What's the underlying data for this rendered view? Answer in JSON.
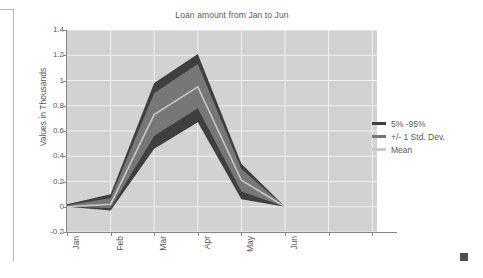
{
  "chart_data": {
    "type": "area",
    "title": "Loan amount from Jan to Jun",
    "xlabel": "",
    "ylabel": "Values in Thousands",
    "categories": [
      "Jan",
      "Feb",
      "Mar",
      "Apr",
      "May",
      "Jun"
    ],
    "ylim": [
      -0.2,
      1.4
    ],
    "yticks": [
      "1.4",
      "1.2",
      "1",
      "0.8",
      "0.6",
      "0.4",
      "0.2",
      "0",
      "-0.2"
    ],
    "ytick_values": [
      1.4,
      1.2,
      1.0,
      0.8,
      0.6,
      0.4,
      0.2,
      0.0,
      -0.2
    ],
    "grid": true,
    "legend_position": "right",
    "series": [
      {
        "name": "5% -95%",
        "band": true,
        "lower": [
          0.0,
          -0.03,
          0.46,
          0.67,
          0.06,
          0.0
        ],
        "upper": [
          0.02,
          0.1,
          0.98,
          1.21,
          0.34,
          0.0
        ],
        "color": "#3f3f3f"
      },
      {
        "name": "+/- 1 Std. Dev.",
        "band": true,
        "lower": [
          0.0,
          -0.01,
          0.56,
          0.78,
          0.12,
          0.0
        ],
        "upper": [
          0.01,
          0.07,
          0.9,
          1.13,
          0.3,
          0.0
        ],
        "color": "#777777"
      },
      {
        "name": "Mean",
        "band": false,
        "values": [
          0.0,
          0.02,
          0.73,
          0.95,
          0.21,
          0.0
        ],
        "color": "#c8c8c8"
      }
    ],
    "legend": [
      {
        "label": "5% -95%",
        "color": "#3f3f3f"
      },
      {
        "label": "+/- 1 Std. Dev.",
        "color": "#777777"
      },
      {
        "label": "Mean",
        "color": "#c8c8c8"
      }
    ],
    "colors": {
      "plot_background": "#d2d2d2",
      "gridline": "#f2f2f2",
      "axis": "#868686",
      "text": "#595959"
    }
  }
}
